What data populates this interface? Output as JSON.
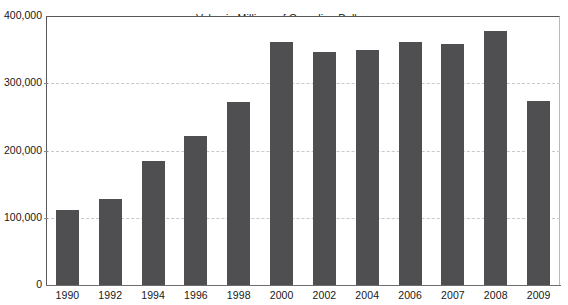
{
  "chart_data": {
    "type": "bar",
    "title": "Value in Millions of Canadian Dollars",
    "xlabel": "",
    "ylabel": "",
    "categories": [
      "1990",
      "1992",
      "1994",
      "1996",
      "1998",
      "2000",
      "2002",
      "2004",
      "2006",
      "2007",
      "2008",
      "2009"
    ],
    "values": [
      111000,
      128000,
      184000,
      222000,
      272000,
      361000,
      347000,
      350000,
      362000,
      358000,
      377000,
      274000
    ],
    "ylim": [
      0,
      400000
    ],
    "y_ticks": [
      0,
      100000,
      200000,
      300000,
      400000
    ],
    "y_tick_labels": [
      "0",
      "100,000",
      "200,000",
      "300,000",
      "400,000"
    ],
    "grid": true,
    "grid_axis": "y",
    "legend": false,
    "series_color": "#4f4f51",
    "background_color": "#ffffff",
    "axis_color": "#58585a",
    "gridline_color": "#c9c9cb"
  }
}
